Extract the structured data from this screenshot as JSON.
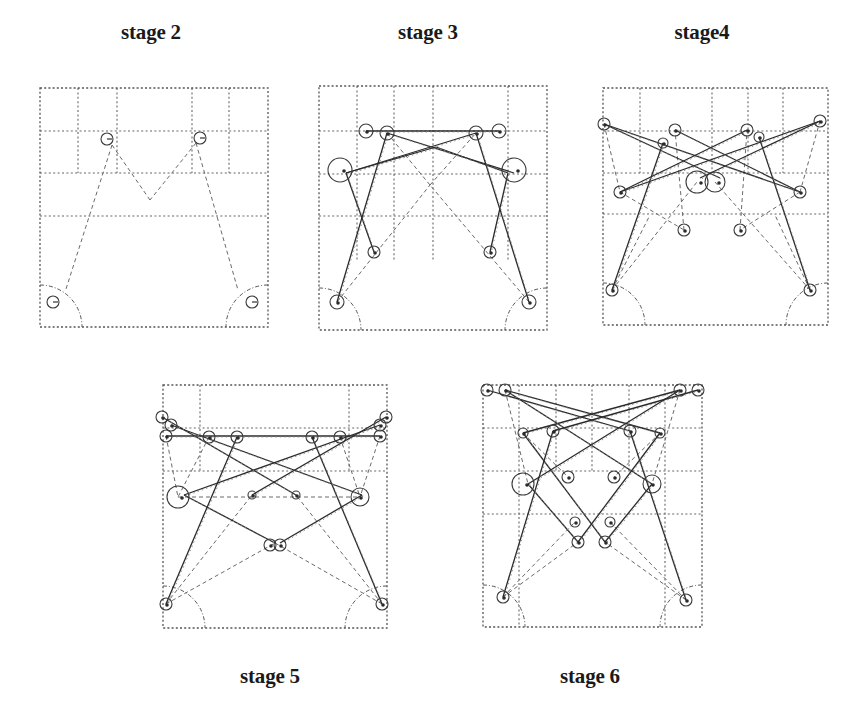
{
  "figure": {
    "panels": [
      {
        "id": "stage2",
        "title": "stage 2",
        "label_pos": [
          151,
          34
        ],
        "box": [
          40,
          88,
          268,
          327
        ],
        "v_grid": [
          [
            78,
            88,
            173
          ],
          [
            117,
            88,
            173
          ],
          [
            192,
            88,
            173
          ],
          [
            229,
            88,
            173
          ]
        ],
        "h_grid": [
          [
            40,
            131,
            268
          ],
          [
            40,
            173,
            268
          ],
          [
            40,
            216,
            268
          ]
        ],
        "nodes": [
          {
            "x": 107,
            "y": 139,
            "r": 6
          },
          {
            "x": 200,
            "y": 138,
            "r": 6
          },
          {
            "x": 53,
            "y": 302,
            "r": 6
          },
          {
            "x": 252,
            "y": 302,
            "r": 6
          }
        ],
        "solid_edges": [],
        "dashed_edges": [
          [
            112,
            145,
            66,
            289
          ],
          [
            196,
            143,
            238,
            290
          ],
          [
            112,
            145,
            150,
            200
          ],
          [
            196,
            143,
            150,
            200
          ]
        ],
        "arcs": [
          {
            "cx": 40,
            "cy": 327,
            "r": 42,
            "corner": "bl"
          },
          {
            "cx": 268,
            "cy": 327,
            "r": 42,
            "corner": "br"
          }
        ]
      },
      {
        "id": "stage3",
        "title": "stage 3",
        "label_pos": [
          428,
          34
        ],
        "box": [
          319,
          86,
          547,
          330
        ],
        "v_grid": [
          [
            357,
            86,
            260
          ],
          [
            394,
            86,
            260
          ],
          [
            433,
            86,
            260
          ],
          [
            508,
            86,
            260
          ]
        ],
        "h_grid": [
          [
            319,
            131,
            547
          ],
          [
            319,
            174,
            547
          ],
          [
            319,
            216,
            547
          ]
        ],
        "nodes": [
          {
            "x": 366,
            "y": 131,
            "r": 7
          },
          {
            "x": 387,
            "y": 133,
            "r": 7
          },
          {
            "x": 476,
            "y": 133,
            "r": 7
          },
          {
            "x": 499,
            "y": 131,
            "r": 7
          },
          {
            "x": 340,
            "y": 170,
            "r": 12
          },
          {
            "x": 514,
            "y": 170,
            "r": 12
          },
          {
            "x": 374,
            "y": 252,
            "r": 6
          },
          {
            "x": 490,
            "y": 252,
            "r": 6
          },
          {
            "x": 337,
            "y": 302,
            "r": 7
          },
          {
            "x": 529,
            "y": 302,
            "r": 7
          }
        ],
        "solid_edges": [
          [
            366,
            131,
            499,
            131
          ],
          [
            387,
            133,
            514,
            173
          ],
          [
            476,
            133,
            346,
            173
          ],
          [
            346,
            173,
            374,
            252
          ],
          [
            508,
            173,
            490,
            252
          ],
          [
            387,
            133,
            337,
            302
          ],
          [
            476,
            133,
            529,
            302
          ],
          [
            346,
            173,
            436,
            147
          ],
          [
            508,
            173,
            436,
            147
          ]
        ],
        "dashed_edges": [
          [
            337,
            302,
            430,
            185
          ],
          [
            529,
            302,
            430,
            185
          ],
          [
            430,
            185,
            387,
            133
          ],
          [
            430,
            185,
            476,
            133
          ]
        ],
        "arcs": [
          {
            "cx": 319,
            "cy": 330,
            "r": 42,
            "corner": "bl"
          },
          {
            "cx": 547,
            "cy": 330,
            "r": 42,
            "corner": "br"
          }
        ]
      },
      {
        "id": "stage4",
        "title": "stage4",
        "label_pos": [
          702,
          34
        ],
        "box": [
          603,
          88,
          828,
          325
        ],
        "v_grid": [
          [
            640,
            88,
            173
          ],
          [
            712,
            88,
            173
          ],
          [
            748,
            88,
            173
          ],
          [
            783,
            88,
            173
          ]
        ],
        "h_grid": [
          [
            603,
            131,
            828
          ],
          [
            603,
            173,
            828
          ],
          [
            603,
            214,
            828
          ]
        ],
        "nodes": [
          {
            "x": 604,
            "y": 124,
            "r": 6
          },
          {
            "x": 675,
            "y": 130,
            "r": 6
          },
          {
            "x": 747,
            "y": 130,
            "r": 6
          },
          {
            "x": 820,
            "y": 121,
            "r": 6
          },
          {
            "x": 663,
            "y": 143,
            "r": 5
          },
          {
            "x": 759,
            "y": 137,
            "r": 5
          },
          {
            "x": 697,
            "y": 182,
            "r": 11
          },
          {
            "x": 715,
            "y": 182,
            "r": 10
          },
          {
            "x": 620,
            "y": 192,
            "r": 6
          },
          {
            "x": 800,
            "y": 192,
            "r": 6
          },
          {
            "x": 684,
            "y": 230,
            "r": 6
          },
          {
            "x": 740,
            "y": 230,
            "r": 6
          },
          {
            "x": 612,
            "y": 290,
            "r": 6
          },
          {
            "x": 810,
            "y": 290,
            "r": 6
          }
        ],
        "solid_edges": [
          [
            604,
            124,
            800,
            192
          ],
          [
            820,
            121,
            620,
            192
          ],
          [
            663,
            143,
            612,
            290
          ],
          [
            759,
            137,
            810,
            290
          ],
          [
            604,
            124,
            720,
            178
          ],
          [
            820,
            121,
            700,
            178
          ],
          [
            675,
            130,
            800,
            192
          ],
          [
            747,
            130,
            620,
            192
          ]
        ],
        "dashed_edges": [
          [
            604,
            124,
            620,
            192
          ],
          [
            820,
            121,
            800,
            192
          ],
          [
            620,
            192,
            684,
            230
          ],
          [
            800,
            192,
            740,
            230
          ],
          [
            612,
            290,
            697,
            182
          ],
          [
            810,
            290,
            715,
            182
          ],
          [
            684,
            230,
            675,
            130
          ],
          [
            740,
            230,
            747,
            130
          ],
          [
            612,
            290,
            650,
            215
          ],
          [
            810,
            290,
            775,
            215
          ]
        ],
        "arcs": [
          {
            "cx": 603,
            "cy": 325,
            "r": 42,
            "corner": "bl"
          },
          {
            "cx": 828,
            "cy": 325,
            "r": 42,
            "corner": "br"
          }
        ]
      },
      {
        "id": "stage5",
        "title": "stage 5",
        "label_pos": [
          270,
          678
        ],
        "box": [
          163,
          385,
          387,
          628
        ],
        "v_grid": [
          [
            200,
            385,
            471
          ],
          [
            349,
            385,
            471
          ]
        ],
        "h_grid": [
          [
            163,
            428,
            387
          ],
          [
            163,
            471,
            387
          ]
        ],
        "nodes": [
          {
            "x": 162,
            "y": 417,
            "r": 6
          },
          {
            "x": 171,
            "y": 425,
            "r": 6
          },
          {
            "x": 166,
            "y": 436,
            "r": 6
          },
          {
            "x": 209,
            "y": 437,
            "r": 6
          },
          {
            "x": 237,
            "y": 437,
            "r": 6
          },
          {
            "x": 312,
            "y": 437,
            "r": 6
          },
          {
            "x": 340,
            "y": 437,
            "r": 6
          },
          {
            "x": 380,
            "y": 425,
            "r": 6
          },
          {
            "x": 386,
            "y": 417,
            "r": 6
          },
          {
            "x": 380,
            "y": 436,
            "r": 6
          },
          {
            "x": 178,
            "y": 497,
            "r": 11
          },
          {
            "x": 360,
            "y": 497,
            "r": 9
          },
          {
            "x": 252,
            "y": 495,
            "r": 4
          },
          {
            "x": 296,
            "y": 495,
            "r": 4
          },
          {
            "x": 270,
            "y": 545,
            "r": 6
          },
          {
            "x": 280,
            "y": 545,
            "r": 6
          },
          {
            "x": 166,
            "y": 604,
            "r": 6
          },
          {
            "x": 382,
            "y": 604,
            "r": 6
          }
        ],
        "solid_edges": [
          [
            166,
            436,
            380,
            436
          ],
          [
            171,
            425,
            362,
            495
          ],
          [
            380,
            425,
            184,
            495
          ],
          [
            184,
            495,
            275,
            543
          ],
          [
            362,
            495,
            280,
            543
          ],
          [
            237,
            437,
            166,
            604
          ],
          [
            312,
            437,
            382,
            604
          ],
          [
            162,
            417,
            296,
            495
          ],
          [
            386,
            417,
            252,
            495
          ]
        ],
        "dashed_edges": [
          [
            166,
            604,
            252,
            495
          ],
          [
            382,
            604,
            296,
            495
          ],
          [
            166,
            604,
            275,
            543
          ],
          [
            382,
            604,
            275,
            543
          ],
          [
            178,
            497,
            360,
            497
          ],
          [
            209,
            437,
            178,
            497
          ],
          [
            340,
            437,
            360,
            497
          ],
          [
            166,
            436,
            178,
            497
          ],
          [
            380,
            436,
            360,
            497
          ]
        ],
        "arcs": [
          {
            "cx": 163,
            "cy": 628,
            "r": 42,
            "corner": "bl"
          },
          {
            "cx": 387,
            "cy": 628,
            "r": 42,
            "corner": "br"
          }
        ]
      },
      {
        "id": "stage6",
        "title": "stage 6",
        "label_pos": [
          590,
          678
        ],
        "box": [
          483,
          385,
          702,
          627
        ],
        "v_grid": [
          [
            519,
            385,
            627
          ],
          [
            556,
            385,
            471
          ],
          [
            592,
            385,
            471
          ],
          [
            629,
            385,
            471
          ],
          [
            665,
            385,
            627
          ]
        ],
        "h_grid": [
          [
            483,
            428,
            702
          ],
          [
            483,
            471,
            702
          ],
          [
            483,
            514,
            702
          ]
        ],
        "nodes": [
          {
            "x": 487,
            "y": 390,
            "r": 6
          },
          {
            "x": 505,
            "y": 390,
            "r": 6
          },
          {
            "x": 680,
            "y": 390,
            "r": 6
          },
          {
            "x": 698,
            "y": 390,
            "r": 6
          },
          {
            "x": 523,
            "y": 433,
            "r": 5
          },
          {
            "x": 553,
            "y": 431,
            "r": 6
          },
          {
            "x": 630,
            "y": 431,
            "r": 6
          },
          {
            "x": 660,
            "y": 433,
            "r": 5
          },
          {
            "x": 568,
            "y": 477,
            "r": 6
          },
          {
            "x": 614,
            "y": 477,
            "r": 6
          },
          {
            "x": 523,
            "y": 484,
            "r": 11
          },
          {
            "x": 652,
            "y": 484,
            "r": 9
          },
          {
            "x": 575,
            "y": 522,
            "r": 5
          },
          {
            "x": 610,
            "y": 522,
            "r": 5
          },
          {
            "x": 578,
            "y": 542,
            "r": 6
          },
          {
            "x": 605,
            "y": 542,
            "r": 6
          },
          {
            "x": 503,
            "y": 597,
            "r": 6
          },
          {
            "x": 686,
            "y": 600,
            "r": 6
          }
        ],
        "solid_edges": [
          [
            505,
            390,
            660,
            433
          ],
          [
            680,
            390,
            523,
            433
          ],
          [
            487,
            390,
            630,
            431
          ],
          [
            698,
            390,
            553,
            431
          ],
          [
            523,
            433,
            605,
            542
          ],
          [
            660,
            433,
            578,
            542
          ],
          [
            528,
            484,
            578,
            542
          ],
          [
            652,
            484,
            605,
            542
          ],
          [
            528,
            484,
            680,
            390
          ],
          [
            652,
            484,
            505,
            390
          ],
          [
            553,
            431,
            503,
            597
          ],
          [
            630,
            431,
            686,
            600
          ]
        ],
        "dashed_edges": [
          [
            503,
            597,
            575,
            522
          ],
          [
            686,
            600,
            610,
            522
          ],
          [
            503,
            597,
            578,
            542
          ],
          [
            686,
            600,
            605,
            542
          ],
          [
            505,
            390,
            528,
            484
          ],
          [
            680,
            390,
            652,
            484
          ],
          [
            523,
            433,
            568,
            477
          ],
          [
            660,
            433,
            614,
            477
          ]
        ],
        "arcs": [
          {
            "cx": 483,
            "cy": 627,
            "r": 42,
            "corner": "bl"
          },
          {
            "cx": 702,
            "cy": 627,
            "r": 42,
            "corner": "br"
          }
        ]
      }
    ]
  }
}
